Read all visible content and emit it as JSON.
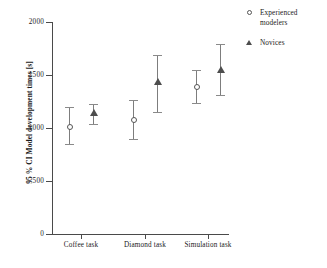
{
  "chart_data": {
    "type": "scatter",
    "title": "",
    "xlabel": "",
    "ylabel": "95 % CI Model development times [s]",
    "categories": [
      "Coffee task",
      "Diamond task",
      "Simulation task"
    ],
    "ylim": [
      0,
      2000
    ],
    "yticks": [
      0,
      500,
      1000,
      1500,
      2000
    ],
    "ytick_labels": [
      "0",
      "500",
      "1000",
      "1500",
      "2000"
    ],
    "grid": false,
    "legend_position": "top-right",
    "error_bar_type": "95% confidence interval",
    "series": [
      {
        "name": "Experienced modelers",
        "marker": "circle",
        "values": [
          1010,
          1075,
          1390
        ],
        "ci_lower": [
          850,
          895,
          1240
        ],
        "ci_upper": [
          1200,
          1260,
          1550
        ]
      },
      {
        "name": "Novices",
        "marker": "triangle",
        "values": [
          1145,
          1435,
          1555
        ],
        "ci_lower": [
          1035,
          1155,
          1310
        ],
        "ci_upper": [
          1225,
          1685,
          1795
        ]
      }
    ]
  },
  "legend": {
    "items": [
      {
        "label": "Experienced modelers",
        "marker": "circle-marker-icon"
      },
      {
        "label": "Novices",
        "marker": "triangle-marker-icon"
      }
    ]
  },
  "colors": {
    "axis": "#4a4a4a",
    "error_bar": "#7d7d7d",
    "marker_circle": "#555555",
    "marker_triangle": "#4d4d4d",
    "text": "#1a1a1a",
    "background": "#ffffff"
  }
}
